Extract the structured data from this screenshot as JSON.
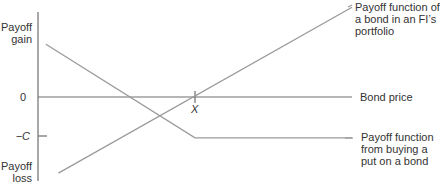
{
  "chart_data": {
    "type": "line",
    "title": "",
    "xlabel": "Bond price",
    "ylabel_top": "Payoff gain",
    "ylabel_bottom": "Payoff loss",
    "y_ticks": [
      {
        "label": "0",
        "value": 0
      },
      {
        "label": "−C",
        "value": -1
      }
    ],
    "x_ticks": [
      {
        "label": "X",
        "value": 1
      }
    ],
    "xlim": [
      0,
      2.0
    ],
    "ylim": [
      -2.0,
      2.4
    ],
    "series": [
      {
        "name": "Payoff function of a bond in an FI's portfolio",
        "points": [
          [
            0.13,
            -1.95
          ],
          [
            2.0,
            2.3
          ]
        ]
      },
      {
        "name": "Payoff function from buying a put on a bond",
        "points": [
          [
            0.05,
            1.35
          ],
          [
            1.0,
            -1.05
          ],
          [
            2.0,
            -1.05
          ]
        ]
      }
    ],
    "annotations": [
      "Payoff function of a bond in an FI's portfolio",
      "Bond price",
      "Payoff function from buying a put on a bond"
    ]
  },
  "labels": {
    "payoff_gain_1": "Payoff",
    "payoff_gain_2": "gain",
    "payoff_loss_1": "Payoff",
    "payoff_loss_2": "loss",
    "zero": "0",
    "minus_c": "−C",
    "x": "X",
    "bond_price": "Bond price",
    "bond_fn_1": "Payoff function of",
    "bond_fn_2": "a bond in an FI’s",
    "bond_fn_3": "portfolio",
    "put_fn_1": "Payoff function",
    "put_fn_2": "from buying a",
    "put_fn_3": "put on a bond"
  },
  "colors": {
    "axis": "#6e6e6e",
    "line": "#9a9a9a",
    "text": "#333333"
  }
}
